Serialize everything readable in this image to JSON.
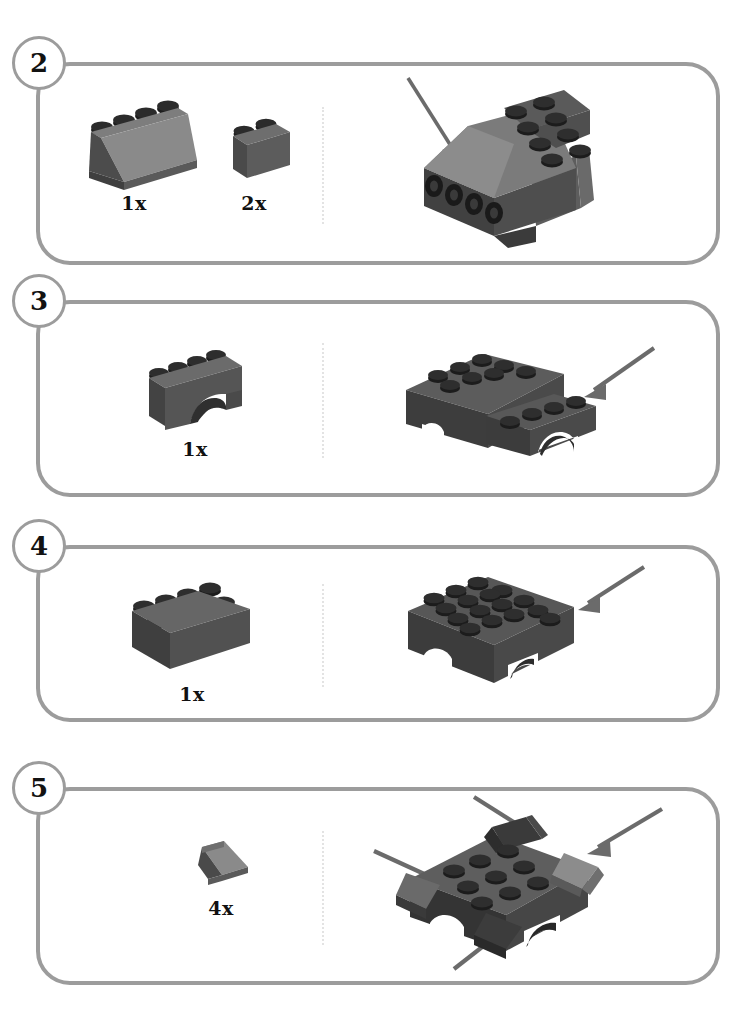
{
  "page": {
    "kind": "lego-building-instructions",
    "background_color": "#ffffff",
    "panel_border_color": "#9c9c9c",
    "divider_color": "#e3e3e3",
    "brick_colors": {
      "dark_gray": "#4a4a4a",
      "mid_gray": "#6e6e6e",
      "light_gray": "#8a8a8a",
      "highlight_gray": "#9a9a9a",
      "stud_black": "#1c1c1c",
      "shadow": "#333333",
      "arrow": "#6b6b6b"
    }
  },
  "steps": [
    {
      "number": "2",
      "badge_name": "step-number-2",
      "parts": [
        {
          "count": "1x",
          "piece": "slope-brick-2x4",
          "piece_label": "slope-brick-2x4"
        },
        {
          "count": "2x",
          "piece": "brick-1x2",
          "piece_label": "brick-1x2"
        }
      ],
      "assembly": {
        "name": "assembly-step-2",
        "description": "sub-assembly with slope roof on top of gray body with four black pins on the left face",
        "arrows": 1
      }
    },
    {
      "number": "3",
      "badge_name": "step-number-3",
      "parts": [
        {
          "count": "1x",
          "piece": "arch-brick-1x4",
          "piece_label": "arch-brick-1x4"
        }
      ],
      "assembly": {
        "name": "assembly-step-3",
        "description": "arch brick being attached to the right side of the growing body",
        "arrows": 1
      }
    },
    {
      "number": "4",
      "badge_name": "step-number-4",
      "parts": [
        {
          "count": "1x",
          "piece": "brick-2x4",
          "piece_label": "brick-2x4"
        }
      ],
      "assembly": {
        "name": "assembly-step-4",
        "description": "2x4 brick placed on top forming a 4x4 stud plate over the arched chassis",
        "arrows": 1
      }
    },
    {
      "number": "5",
      "badge_name": "step-number-5",
      "parts": [
        {
          "count": "4x",
          "piece": "slope-brick-1x1",
          "piece_label": "slope-brick-1x1"
        }
      ],
      "assembly": {
        "name": "assembly-step-5",
        "description": "four 1x1 slopes being added to the four corners of the 4x4 top",
        "arrows": 4
      }
    }
  ]
}
